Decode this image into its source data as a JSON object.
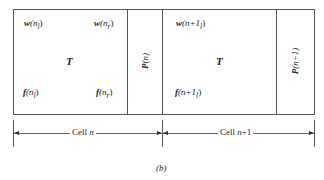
{
  "figure": {
    "caption": "(b)",
    "cell_n": {
      "T_label": "T",
      "top_left": {
        "sym": "w",
        "arg": "(n",
        "sub": "l",
        "close": ")"
      },
      "top_right": {
        "sym": "w",
        "arg": "(n",
        "sub": "r",
        "close": ")"
      },
      "bottom_left": {
        "sym": "f",
        "arg": "(n",
        "sub": "l",
        "close": ")"
      },
      "bottom_right": {
        "sym": "f",
        "arg": "(n",
        "sub": "r",
        "close": ")"
      },
      "P_label": {
        "sym": "P",
        "arg": "(n)"
      }
    },
    "cell_n1": {
      "T_label": "T",
      "top_left": {
        "sym": "w",
        "arg": "(n+1",
        "sub": "l",
        "close": ")"
      },
      "bottom_left": {
        "sym": "f",
        "arg": "(n+1",
        "sub": "l",
        "close": ")"
      },
      "P_label": {
        "sym": "P",
        "arg": "(n+1)"
      }
    },
    "dimension_labels": [
      {
        "text": "Cell ",
        "var": "n",
        "suffix": ""
      },
      {
        "text": "Cell ",
        "var": "n",
        "suffix": "+1"
      }
    ]
  }
}
